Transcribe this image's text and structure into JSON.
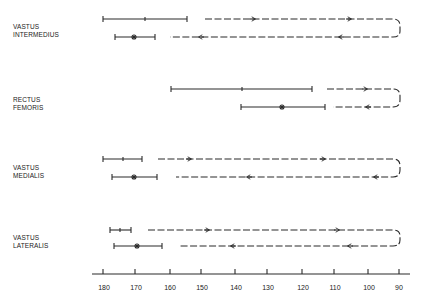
{
  "diagram": {
    "axis": {
      "ticks": [
        "180",
        "170",
        "160",
        "150",
        "140",
        "130",
        "120",
        "110",
        "100",
        "90"
      ],
      "tick_x": [
        103,
        135,
        170,
        201,
        235,
        267,
        302,
        334,
        368,
        399
      ]
    },
    "muscles": [
      {
        "name_line1": "VASTUS",
        "name_line2": "INTERMEDIUS"
      },
      {
        "name_line1": "RECTUS",
        "name_line2": "FEMORIS"
      },
      {
        "name_line1": "VASTUS",
        "name_line2": "MEDIALIS"
      },
      {
        "name_line1": "VASTUS",
        "name_line2": "LATERALIS"
      }
    ],
    "colors": {
      "ink": "#2a2a2a",
      "background": "#ffffff"
    }
  }
}
